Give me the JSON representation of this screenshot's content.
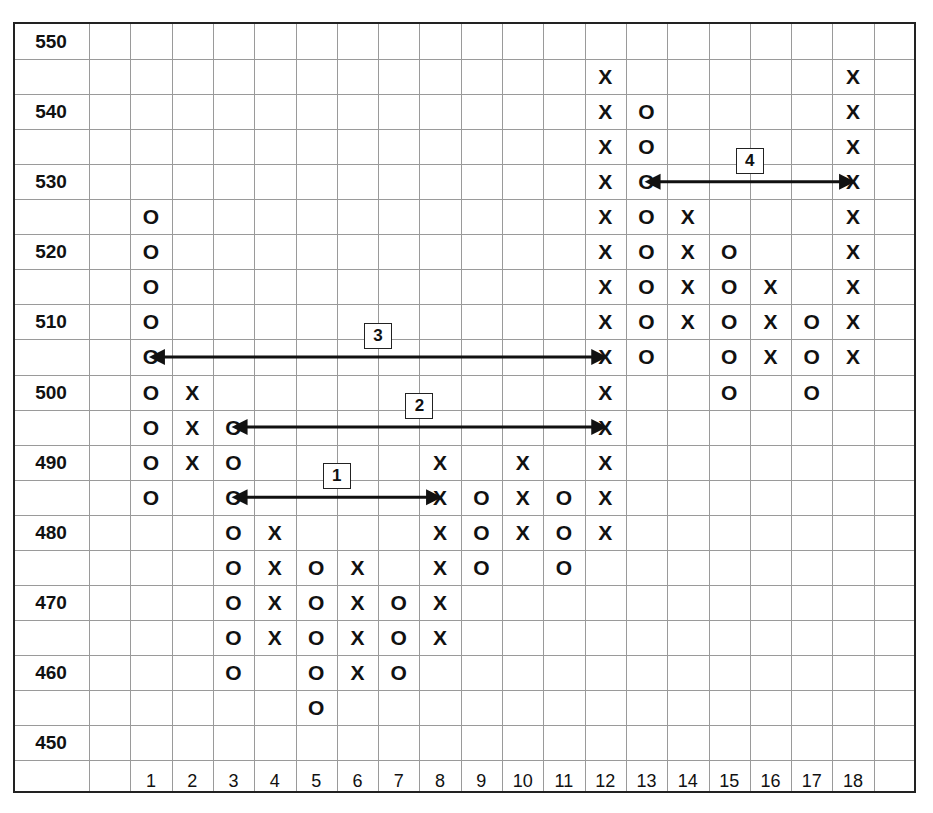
{
  "chart_data": {
    "type": "point-and-figure",
    "title": "",
    "xlabel": "Column",
    "ylabel": "Price",
    "box_size": 5,
    "y_ticks": [
      550,
      540,
      530,
      520,
      510,
      500,
      490,
      480,
      470,
      460,
      450
    ],
    "ylim": [
      450,
      550
    ],
    "x_ticks": [
      "1",
      "2",
      "3",
      "4",
      "5",
      "6",
      "7",
      "8",
      "9",
      "10",
      "11",
      "12",
      "13",
      "14",
      "15",
      "16",
      "17",
      "18"
    ],
    "columns": [
      {
        "col": 1,
        "type": "O",
        "high": 525,
        "low": 485
      },
      {
        "col": 2,
        "type": "X",
        "low": 490,
        "high": 500
      },
      {
        "col": 3,
        "type": "O",
        "high": 495,
        "low": 460
      },
      {
        "col": 4,
        "type": "X",
        "low": 465,
        "high": 480
      },
      {
        "col": 5,
        "type": "O",
        "high": 475,
        "low": 455
      },
      {
        "col": 6,
        "type": "X",
        "low": 460,
        "high": 475
      },
      {
        "col": 7,
        "type": "O",
        "high": 470,
        "low": 460
      },
      {
        "col": 8,
        "type": "X",
        "low": 465,
        "high": 490
      },
      {
        "col": 9,
        "type": "O",
        "high": 485,
        "low": 475
      },
      {
        "col": 10,
        "type": "X",
        "low": 480,
        "high": 490
      },
      {
        "col": 11,
        "type": "O",
        "high": 485,
        "low": 475
      },
      {
        "col": 12,
        "type": "X",
        "low": 480,
        "high": 545
      },
      {
        "col": 13,
        "type": "O",
        "high": 540,
        "low": 505
      },
      {
        "col": 14,
        "type": "X",
        "low": 510,
        "high": 525
      },
      {
        "col": 15,
        "type": "O",
        "high": 520,
        "low": 500
      },
      {
        "col": 16,
        "type": "X",
        "low": 505,
        "high": 515
      },
      {
        "col": 17,
        "type": "O",
        "high": 510,
        "low": 500
      },
      {
        "col": 18,
        "type": "X",
        "low": 505,
        "high": 545
      }
    ],
    "annotations": [
      {
        "label": "1",
        "from_col": 3,
        "to_col": 8,
        "price": 485,
        "arrow": "both"
      },
      {
        "label": "2",
        "from_col": 3,
        "to_col": 12,
        "price": 495,
        "arrow": "both"
      },
      {
        "label": "3",
        "from_col": 1,
        "to_col": 12,
        "price": 505,
        "arrow": "both"
      },
      {
        "label": "4",
        "from_col": 13,
        "to_col": 18,
        "price": 530,
        "arrow": "both"
      }
    ],
    "grid": true,
    "legend": null
  }
}
